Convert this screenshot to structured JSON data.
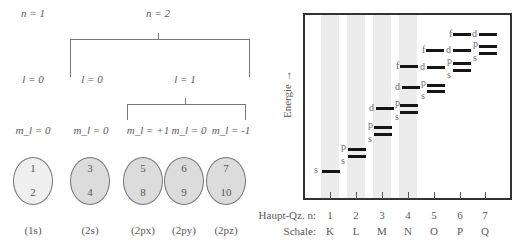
{
  "left_diagram": {
    "n_labels": [
      "n = 1",
      "n = 2"
    ],
    "l_labels": [
      "l = 0",
      "l = 0",
      "l = 1"
    ],
    "ml_labels": [
      "m_l = 0",
      "m_l = 0",
      "m_l = +1",
      "m_l = 0",
      "m_l = -1"
    ],
    "orbitals": [
      {
        "top": "1",
        "bottom": "2",
        "label": "(1s)",
        "shade": "light"
      },
      {
        "top": "3",
        "bottom": "4",
        "label": "(2s)",
        "shade": "dark"
      },
      {
        "top": "5",
        "bottom": "8",
        "label": "(2px)",
        "shade": "dark"
      },
      {
        "top": "6",
        "bottom": "9",
        "label": "(2py)",
        "shade": "dark"
      },
      {
        "top": "7",
        "bottom": "10",
        "label": "(2pz)",
        "shade": "dark"
      }
    ]
  },
  "right_diagram": {
    "y_axis_label": "Energie →",
    "row_labels": {
      "n": "Haupt-Qz. n:",
      "shell": "Schale:"
    },
    "quantum_numbers": [
      "1",
      "2",
      "3",
      "4",
      "5",
      "6",
      "7"
    ],
    "shells": [
      "K",
      "L",
      "M",
      "N",
      "O",
      "P",
      "Q"
    ],
    "levels": [
      {
        "shell": 1,
        "sub": "s"
      },
      {
        "shell": 2,
        "sub": "s"
      },
      {
        "shell": 2,
        "sub": "p"
      },
      {
        "shell": 3,
        "sub": "s"
      },
      {
        "shell": 3,
        "sub": "p"
      },
      {
        "shell": 3,
        "sub": "d"
      },
      {
        "shell": 4,
        "sub": "s"
      },
      {
        "shell": 4,
        "sub": "p"
      },
      {
        "shell": 4,
        "sub": "d"
      },
      {
        "shell": 4,
        "sub": "f"
      },
      {
        "shell": 5,
        "sub": "s"
      },
      {
        "shell": 5,
        "sub": "p"
      },
      {
        "shell": 5,
        "sub": "d"
      },
      {
        "shell": 5,
        "sub": "f"
      },
      {
        "shell": 6,
        "sub": "s"
      },
      {
        "shell": 6,
        "sub": "p"
      },
      {
        "shell": 6,
        "sub": "d"
      },
      {
        "shell": 6,
        "sub": "f"
      },
      {
        "shell": 7,
        "sub": "s"
      },
      {
        "shell": 7,
        "sub": "p"
      },
      {
        "shell": 7,
        "sub": "d"
      }
    ]
  }
}
